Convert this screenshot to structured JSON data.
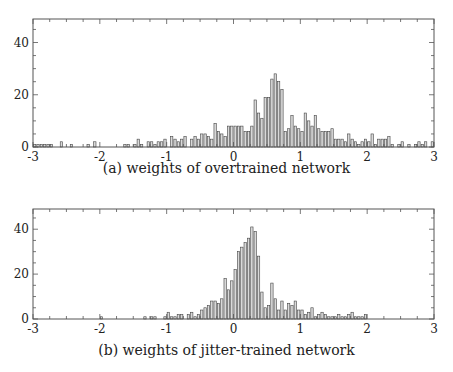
{
  "chart_data": [
    {
      "type": "bar",
      "title": "(a) weights of overtrained network",
      "xlabel": "",
      "ylabel": "",
      "xlim": [
        -3,
        3
      ],
      "ylim": [
        0,
        49
      ],
      "xticks": [
        "-3",
        "-2",
        "-1",
        "0",
        "1",
        "2",
        "3"
      ],
      "yticks": [
        "0",
        "20",
        "40"
      ],
      "bin_width": 0.05,
      "bin_start": -3,
      "values": [
        1,
        1,
        1,
        1,
        1,
        1,
        0,
        0,
        2,
        0,
        0,
        1,
        0,
        0,
        0,
        0,
        1,
        0,
        2,
        0,
        0,
        0,
        0,
        0,
        0,
        0,
        0,
        1,
        1,
        0,
        1,
        3,
        1,
        0,
        2,
        2,
        1,
        2,
        2,
        3,
        0,
        4,
        3,
        2,
        3,
        4,
        0,
        3,
        4,
        3,
        5,
        5,
        4,
        3,
        9,
        6,
        5,
        4,
        8,
        8,
        8,
        8,
        8,
        6,
        6,
        8,
        18,
        13,
        11,
        19,
        19,
        26,
        28,
        25,
        22,
        6,
        7,
        12,
        8,
        7,
        6,
        13,
        10,
        8,
        12,
        7,
        6,
        6,
        6,
        7,
        3,
        3,
        3,
        2,
        5,
        3,
        2,
        1,
        2,
        3,
        2,
        5,
        1,
        3,
        3,
        3,
        4,
        1,
        0,
        1,
        2,
        0,
        1,
        0,
        1,
        2,
        1,
        2,
        0,
        2
      ],
      "bar_color": "#d9d9d9",
      "edge_color": "#444444"
    },
    {
      "type": "bar",
      "title": "(b) weights of jitter-trained network",
      "xlabel": "",
      "ylabel": "",
      "xlim": [
        -3,
        3
      ],
      "ylim": [
        0,
        49
      ],
      "xticks": [
        "-3",
        "-2",
        "-1",
        "0",
        "1",
        "2",
        "3"
      ],
      "yticks": [
        "0",
        "20",
        "40"
      ],
      "bin_width": 0.05,
      "bin_start": -3,
      "values": [
        0,
        0,
        0,
        0,
        0,
        0,
        0,
        0,
        0,
        0,
        0,
        0,
        0,
        0,
        0,
        0,
        0,
        0,
        0,
        0,
        1,
        0,
        0,
        0,
        0,
        0,
        0,
        0,
        0,
        0,
        0,
        0,
        0,
        1,
        0,
        1,
        1,
        0,
        0,
        1,
        3,
        1,
        1,
        2,
        2,
        0,
        2,
        3,
        1,
        2,
        4,
        5,
        6,
        8,
        8,
        7,
        9,
        18,
        13,
        17,
        22,
        30,
        32,
        34,
        36,
        41,
        39,
        28,
        12,
        5,
        6,
        16,
        9,
        4,
        8,
        4,
        7,
        6,
        8,
        4,
        4,
        2,
        3,
        5,
        1,
        2,
        3,
        2,
        1,
        1,
        1,
        2,
        1,
        1,
        2,
        3,
        1,
        1,
        1,
        2,
        0,
        0,
        0,
        0,
        0,
        0,
        0,
        0,
        0,
        0,
        0,
        0,
        0,
        0,
        0,
        0,
        0,
        0,
        0,
        0
      ],
      "bar_color": "#d9d9d9",
      "edge_color": "#444444"
    }
  ],
  "captions": {
    "a": "(a) weights of overtrained network",
    "b": "(b) weights of jitter-trained network"
  }
}
